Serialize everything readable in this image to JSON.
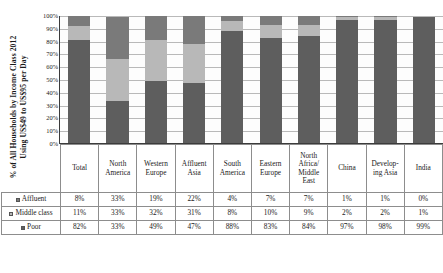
{
  "chart_data": {
    "type": "bar",
    "subtype": "stacked-100-percent-column",
    "title": "",
    "axis_title_lines": [
      "% of All Households by Income Class 2012",
      "Using US$49 to US$95 per Day"
    ],
    "xlabel": "",
    "ylabel": "% of All Households by Income Class 2012 Using US$49 to US$95 per Day",
    "ylim": [
      0,
      100
    ],
    "ytick_labels": [
      "100%",
      "90%",
      "80%",
      "70%",
      "60%",
      "50%",
      "40%",
      "30%",
      "20%",
      "10%",
      "0%"
    ],
    "ytick_values": [
      100,
      90,
      80,
      70,
      60,
      50,
      40,
      30,
      20,
      10,
      0
    ],
    "grid": true,
    "legend_position": "table-row-headers",
    "categories": [
      "Total",
      "North America",
      "Western Europe",
      "Affluent Asia",
      "South America",
      "Eastern Europe",
      "North Africa/ Middle East",
      "China",
      "Developing Asia",
      "India"
    ],
    "category_lines": [
      [
        "Total"
      ],
      [
        "North",
        "America"
      ],
      [
        "Western",
        "Europe"
      ],
      [
        "Affluent",
        "Asia"
      ],
      [
        "South",
        "America"
      ],
      [
        "Eastern",
        "Europe"
      ],
      [
        "North",
        "Africa/",
        "Middle",
        "East"
      ],
      [
        "China"
      ],
      [
        "Develop-",
        "ing Asia"
      ],
      [
        "India"
      ]
    ],
    "series": [
      {
        "name": "Affluent",
        "color": "#7a7a7a",
        "values": [
          8,
          33,
          19,
          22,
          4,
          7,
          7,
          1,
          1,
          0
        ],
        "labels": [
          "8%",
          "33%",
          "19%",
          "22%",
          "4%",
          "7%",
          "7%",
          "1%",
          "1%",
          "0%"
        ]
      },
      {
        "name": "Middle class",
        "color": "#b8b8b8",
        "values": [
          11,
          33,
          32,
          31,
          8,
          10,
          9,
          2,
          2,
          1
        ],
        "labels": [
          "11%",
          "33%",
          "32%",
          "31%",
          "8%",
          "10%",
          "9%",
          "2%",
          "2%",
          "1%"
        ]
      },
      {
        "name": "Poor",
        "color": "#5e5e5e",
        "values": [
          82,
          33,
          49,
          47,
          88,
          83,
          84,
          97,
          98,
          99
        ],
        "labels": [
          "82%",
          "33%",
          "49%",
          "47%",
          "88%",
          "83%",
          "84%",
          "97%",
          "98%",
          "99%"
        ]
      }
    ],
    "stack_order_bottom_to_top": [
      "Poor",
      "Middle class",
      "Affluent"
    ]
  },
  "table": {
    "corner_label": "",
    "row_labels": [
      "Affluent",
      "Middle class",
      "Poor"
    ]
  },
  "colors": {
    "poor": "#5e5e5e",
    "middle_class": "#b8b8b8",
    "affluent": "#7a7a7a",
    "gridline": "#b9b9b9",
    "axis": "#3b3b3b",
    "table_border": "#8d8d8d",
    "plot_background": "#fdfdfd",
    "page_background": "#ffffff"
  }
}
